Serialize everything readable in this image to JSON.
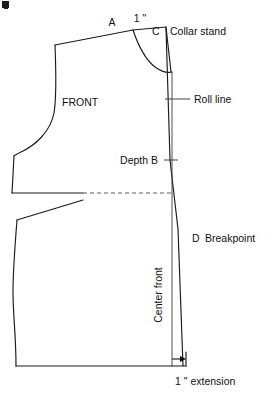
{
  "diagram": {
    "piece_label": "FRONT",
    "labels": {
      "point_a": "A",
      "measure_top": "1 \"",
      "point_c": "C",
      "collar_stand": "Collar stand",
      "roll_line": "Roll line",
      "depth_b": "Depth B",
      "point_d": "D",
      "breakpoint": "Breakpoint",
      "center_front": "Center front",
      "extension": "1 \" extension"
    },
    "colors": {
      "outline": "#1a1a1a",
      "guide": "#3a3a3a",
      "dashed": "#4a4a4a",
      "background": "#ffffff",
      "text": "#111111"
    },
    "geometry": {
      "shoulder_tip": [
        55,
        45
      ],
      "point_a": [
        133,
        30
      ],
      "point_c": [
        166,
        27
      ],
      "neck_curve_end": [
        172,
        72
      ],
      "depth_b": [
        170,
        160
      ],
      "breakpoint_d": [
        178,
        228
      ],
      "center_front_x": 172,
      "extension_x": 186,
      "waist_y": 193,
      "hem_y": 366
    }
  }
}
